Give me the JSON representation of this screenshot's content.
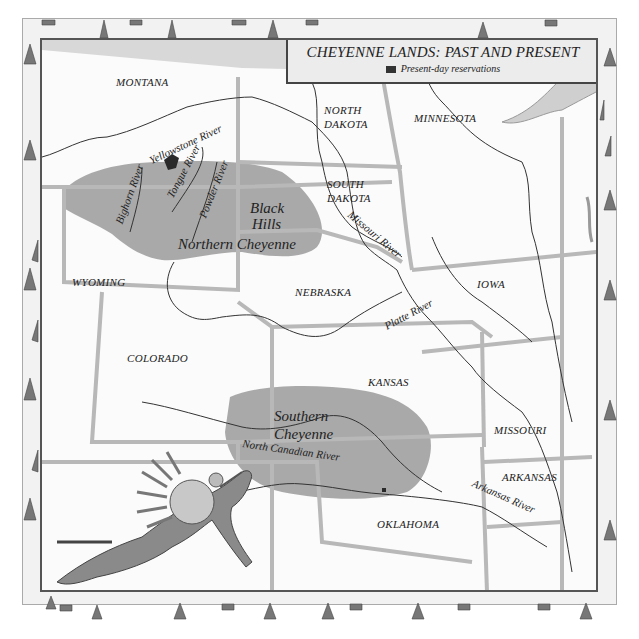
{
  "legend": {
    "title": "CHEYENNE LANDS: PAST AND PRESENT",
    "key_label": "Present-day reservations",
    "key_color": "#333333"
  },
  "states": {
    "montana": "MONTANA",
    "north_dakota_1": "NORTH",
    "north_dakota_2": "DAKOTA",
    "minnesota": "MINNESOTA",
    "south_dakota_1": "SOUTH",
    "south_dakota_2": "DAKOTA",
    "wyoming": "WYOMING",
    "nebraska": "NEBRASKA",
    "iowa": "IOWA",
    "colorado": "COLORADO",
    "kansas": "KANSAS",
    "missouri": "MISSOURI",
    "arkansas": "ARKANSAS",
    "oklahoma": "OKLAHOMA"
  },
  "rivers": {
    "yellowstone": "Yellowstone River",
    "bighorn": "Bighorn River",
    "tongue": "Tongue River",
    "powder": "Powder River",
    "missouri": "Missouri River",
    "platte": "Platte River",
    "north_canadian": "North Canadian River",
    "arkansas": "Arkansas River"
  },
  "regions": {
    "northern_1": "Northern Cheyenne",
    "black_hills_1": "Black",
    "black_hills_2": "Hills",
    "southern_1": "Southern",
    "southern_2": "Cheyenne"
  },
  "colors": {
    "territory": "#9a9a9a",
    "border": "#b8b8b8",
    "river": "#333333",
    "reservation": "#2a2a2a"
  }
}
